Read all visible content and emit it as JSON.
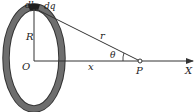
{
  "diagram": {
    "labels": {
      "dl": "dl",
      "dq": "dq",
      "R": "R",
      "O": "O",
      "x": "x",
      "r": "r",
      "theta": "θ",
      "P": "P",
      "X": "X"
    },
    "colors": {
      "ring": "#6e6e6e",
      "ring_outline": "#333333",
      "element": "#2a2a2a",
      "line": "#333333"
    }
  }
}
